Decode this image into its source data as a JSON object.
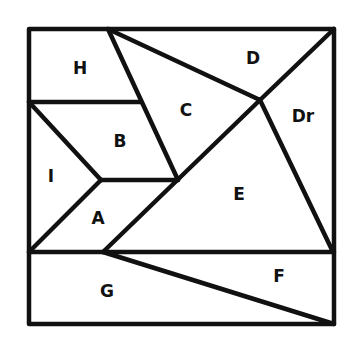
{
  "diagram": {
    "type": "tangram-puzzle",
    "regions": [
      {
        "id": "H",
        "label": "H"
      },
      {
        "id": "D",
        "label": "D"
      },
      {
        "id": "C",
        "label": "C"
      },
      {
        "id": "Dr",
        "label": "Dr"
      },
      {
        "id": "B",
        "label": "B"
      },
      {
        "id": "I",
        "label": "I"
      },
      {
        "id": "E",
        "label": "E"
      },
      {
        "id": "A",
        "label": "A"
      },
      {
        "id": "F",
        "label": "F"
      },
      {
        "id": "G",
        "label": "G"
      }
    ],
    "colors": {
      "stroke": "#111111",
      "background": "#ffffff"
    }
  }
}
